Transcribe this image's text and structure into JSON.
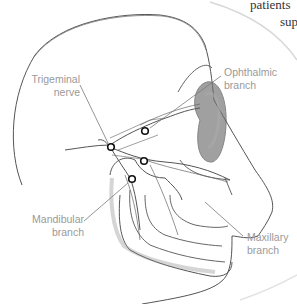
{
  "figure": {
    "background_text": [
      "patients",
      "sup"
    ],
    "labels": [
      {
        "id": "trigeminal",
        "lines": [
          "Trigeminal",
          "nerve"
        ]
      },
      {
        "id": "ophthalmic",
        "lines": [
          "Ophthalmic",
          "branch"
        ]
      },
      {
        "id": "mandibular",
        "lines": [
          "Mandibular",
          "branch"
        ]
      },
      {
        "id": "maxillary",
        "lines": [
          "Maxillary",
          "branch"
        ]
      }
    ],
    "colors": {
      "label_text": "#9a9a9a",
      "leader_line": "#7a7a7a",
      "sketch_line": "#555555",
      "shading": "#888888"
    }
  }
}
